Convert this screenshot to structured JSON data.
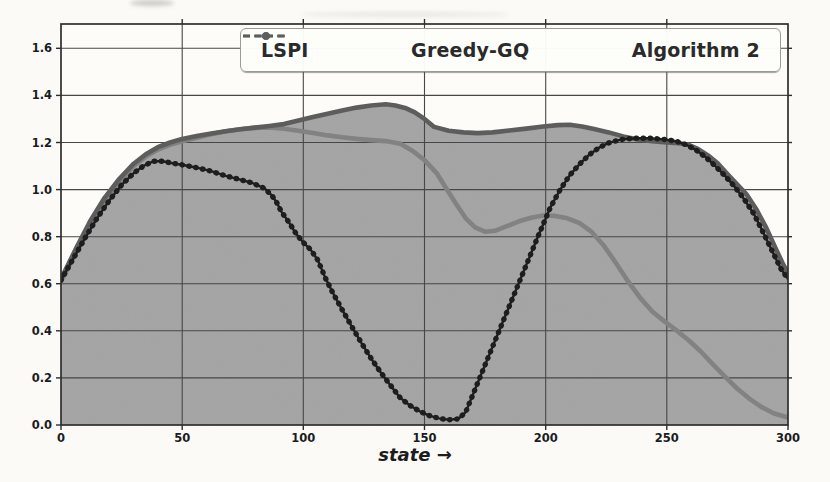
{
  "figure": {
    "xlabel": "state →",
    "background": "#fbfaf7",
    "plot_background": "#fdfcf9",
    "grid_color": "#474747",
    "frame_color": "#2e2e2e",
    "tick_label_color": "#1c1c1c",
    "x_tick_labels": [
      "0",
      "50",
      "100",
      "150",
      "200",
      "250",
      "300"
    ],
    "y_tick_labels": [
      "0.0",
      "0.2",
      "0.4",
      "0.6",
      "0.8",
      "1.0",
      "1.2",
      "1.4",
      "1.6"
    ]
  },
  "chart_data": {
    "type": "line",
    "title": "",
    "xlabel": "state →",
    "ylabel": "",
    "xlim": [
      0,
      300
    ],
    "ylim": [
      0,
      1.7
    ],
    "x_ticks": [
      0,
      50,
      100,
      150,
      200,
      250,
      300
    ],
    "y_ticks": [
      0.0,
      0.2,
      0.4,
      0.6,
      0.8,
      1.0,
      1.2,
      1.4,
      1.6
    ],
    "grid": true,
    "legend_position": "upper center",
    "series": [
      {
        "name": "LSPI",
        "color": "#1e1e1e",
        "line_style": "solid with dot markers",
        "points": [
          [
            0,
            0.615
          ],
          [
            5,
            0.705
          ],
          [
            10,
            0.795
          ],
          [
            15,
            0.88
          ],
          [
            20,
            0.955
          ],
          [
            25,
            1.02
          ],
          [
            30,
            1.07
          ],
          [
            34,
            1.1
          ],
          [
            38,
            1.12
          ],
          [
            42,
            1.12
          ],
          [
            46,
            1.112
          ],
          [
            51,
            1.103
          ],
          [
            56,
            1.093
          ],
          [
            62,
            1.078
          ],
          [
            68,
            1.058
          ],
          [
            74,
            1.042
          ],
          [
            79,
            1.028
          ],
          [
            84,
            1.005
          ],
          [
            87,
            0.975
          ],
          [
            89,
            0.945
          ],
          [
            91,
            0.905
          ],
          [
            94,
            0.862
          ],
          [
            97,
            0.812
          ],
          [
            100,
            0.775
          ],
          [
            103,
            0.745
          ],
          [
            106,
            0.7
          ],
          [
            109,
            0.627
          ],
          [
            112,
            0.565
          ],
          [
            116,
            0.49
          ],
          [
            120,
            0.418
          ],
          [
            124,
            0.348
          ],
          [
            128,
            0.282
          ],
          [
            132,
            0.222
          ],
          [
            136,
            0.168
          ],
          [
            140,
            0.115
          ],
          [
            144,
            0.083
          ],
          [
            148,
            0.058
          ],
          [
            152,
            0.04
          ],
          [
            156,
            0.028
          ],
          [
            160,
            0.022
          ],
          [
            164,
            0.026
          ],
          [
            167,
            0.055
          ],
          [
            172,
            0.18
          ],
          [
            177,
            0.305
          ],
          [
            182,
            0.43
          ],
          [
            187,
            0.555
          ],
          [
            192,
            0.68
          ],
          [
            197,
            0.805
          ],
          [
            202,
            0.925
          ],
          [
            206,
            1.0
          ],
          [
            210,
            1.062
          ],
          [
            214,
            1.108
          ],
          [
            218,
            1.148
          ],
          [
            222,
            1.178
          ],
          [
            226,
            1.198
          ],
          [
            231,
            1.212
          ],
          [
            237,
            1.218
          ],
          [
            243,
            1.218
          ],
          [
            249,
            1.213
          ],
          [
            254,
            1.205
          ],
          [
            258,
            1.19
          ],
          [
            262,
            1.168
          ],
          [
            266,
            1.138
          ],
          [
            270,
            1.1
          ],
          [
            274,
            1.058
          ],
          [
            278,
            1.012
          ],
          [
            282,
            0.958
          ],
          [
            286,
            0.895
          ],
          [
            290,
            0.812
          ],
          [
            294,
            0.728
          ],
          [
            297,
            0.665
          ],
          [
            300,
            0.62
          ]
        ]
      },
      {
        "name": "Greedy-GQ",
        "color": "#828282",
        "line_style": "solid thick",
        "points": [
          [
            0,
            0.61
          ],
          [
            6,
            0.73
          ],
          [
            12,
            0.85
          ],
          [
            18,
            0.95
          ],
          [
            24,
            1.03
          ],
          [
            30,
            1.1
          ],
          [
            35,
            1.14
          ],
          [
            40,
            1.17
          ],
          [
            45,
            1.19
          ],
          [
            50,
            1.205
          ],
          [
            56,
            1.22
          ],
          [
            62,
            1.235
          ],
          [
            68,
            1.248
          ],
          [
            74,
            1.256
          ],
          [
            80,
            1.262
          ],
          [
            86,
            1.264
          ],
          [
            92,
            1.258
          ],
          [
            98,
            1.25
          ],
          [
            104,
            1.24
          ],
          [
            110,
            1.23
          ],
          [
            116,
            1.222
          ],
          [
            122,
            1.215
          ],
          [
            128,
            1.21
          ],
          [
            134,
            1.206
          ],
          [
            140,
            1.195
          ],
          [
            145,
            1.165
          ],
          [
            150,
            1.125
          ],
          [
            155,
            1.07
          ],
          [
            159,
            1.005
          ],
          [
            163,
            0.94
          ],
          [
            167,
            0.878
          ],
          [
            171,
            0.838
          ],
          [
            175,
            0.821
          ],
          [
            179,
            0.825
          ],
          [
            184,
            0.845
          ],
          [
            189,
            0.865
          ],
          [
            194,
            0.88
          ],
          [
            199,
            0.89
          ],
          [
            204,
            0.888
          ],
          [
            209,
            0.878
          ],
          [
            214,
            0.857
          ],
          [
            219,
            0.82
          ],
          [
            224,
            0.762
          ],
          [
            229,
            0.688
          ],
          [
            234,
            0.61
          ],
          [
            239,
            0.54
          ],
          [
            244,
            0.482
          ],
          [
            249,
            0.44
          ],
          [
            254,
            0.402
          ],
          [
            259,
            0.36
          ],
          [
            264,
            0.312
          ],
          [
            269,
            0.258
          ],
          [
            274,
            0.205
          ],
          [
            279,
            0.155
          ],
          [
            284,
            0.112
          ],
          [
            289,
            0.077
          ],
          [
            294,
            0.05
          ],
          [
            300,
            0.032
          ]
        ]
      },
      {
        "name": "Algorithm 2",
        "color": "#5d5d5d",
        "line_style": "solid thick",
        "fill_under": true,
        "fill_color": "#a6a6a6",
        "points": [
          [
            0,
            0.62
          ],
          [
            6,
            0.745
          ],
          [
            12,
            0.865
          ],
          [
            18,
            0.965
          ],
          [
            24,
            1.045
          ],
          [
            30,
            1.11
          ],
          [
            35,
            1.15
          ],
          [
            40,
            1.18
          ],
          [
            45,
            1.2
          ],
          [
            50,
            1.215
          ],
          [
            56,
            1.228
          ],
          [
            62,
            1.238
          ],
          [
            68,
            1.248
          ],
          [
            74,
            1.256
          ],
          [
            80,
            1.263
          ],
          [
            86,
            1.27
          ],
          [
            92,
            1.278
          ],
          [
            98,
            1.293
          ],
          [
            104,
            1.308
          ],
          [
            110,
            1.322
          ],
          [
            116,
            1.336
          ],
          [
            122,
            1.348
          ],
          [
            128,
            1.357
          ],
          [
            134,
            1.362
          ],
          [
            138,
            1.357
          ],
          [
            142,
            1.347
          ],
          [
            146,
            1.328
          ],
          [
            150,
            1.3
          ],
          [
            154,
            1.266
          ],
          [
            160,
            1.25
          ],
          [
            166,
            1.243
          ],
          [
            172,
            1.24
          ],
          [
            178,
            1.243
          ],
          [
            185,
            1.251
          ],
          [
            192,
            1.259
          ],
          [
            199,
            1.268
          ],
          [
            205,
            1.274
          ],
          [
            210,
            1.275
          ],
          [
            215,
            1.268
          ],
          [
            220,
            1.257
          ],
          [
            226,
            1.243
          ],
          [
            232,
            1.226
          ],
          [
            238,
            1.213
          ],
          [
            244,
            1.206
          ],
          [
            250,
            1.2
          ],
          [
            255,
            1.197
          ],
          [
            259,
            1.19
          ],
          [
            263,
            1.172
          ],
          [
            267,
            1.145
          ],
          [
            271,
            1.112
          ],
          [
            275,
            1.066
          ],
          [
            279,
            1.022
          ],
          [
            283,
            0.978
          ],
          [
            287,
            0.915
          ],
          [
            291,
            0.838
          ],
          [
            295,
            0.748
          ],
          [
            298,
            0.682
          ],
          [
            300,
            0.645
          ]
        ]
      }
    ]
  }
}
